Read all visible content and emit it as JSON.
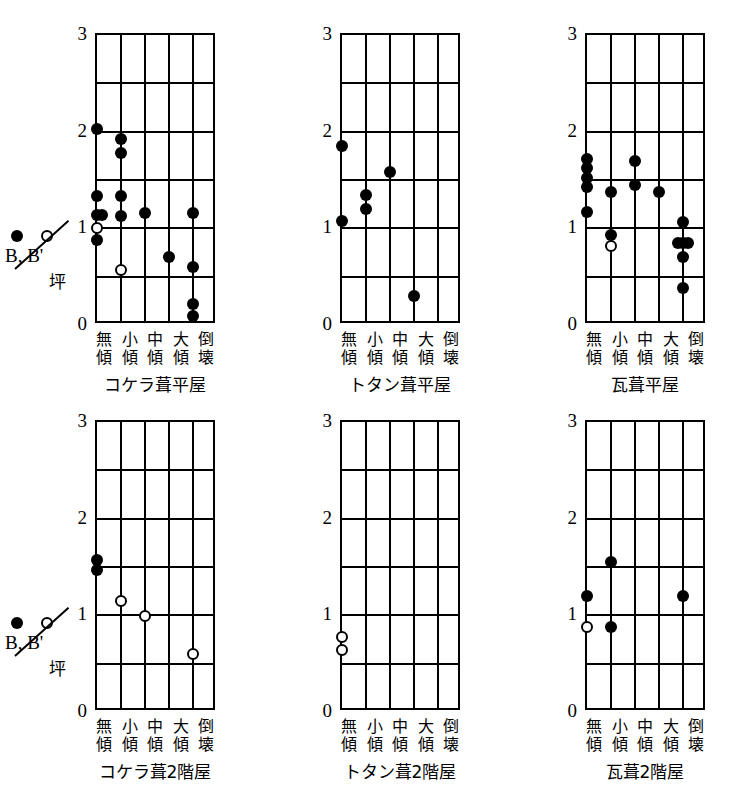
{
  "figure": {
    "legend": {
      "filled_symbol": "filled-circle",
      "open_symbol": "open-circle",
      "numerator": "B, B'",
      "denominator": "坪",
      "filled_label": "B",
      "open_label": "B'"
    },
    "axis": {
      "y_ticks": [
        "3",
        "2",
        "1",
        "0"
      ],
      "y_values": [
        3,
        2,
        1,
        0
      ],
      "y_min": 0,
      "y_max": 3,
      "y_minor_step": 0.5,
      "x_categories": [
        {
          "top": "無",
          "bottom": "傾"
        },
        {
          "top": "小",
          "bottom": "傾"
        },
        {
          "top": "中",
          "bottom": "傾"
        },
        {
          "top": "大",
          "bottom": "傾"
        },
        {
          "top": "倒",
          "bottom": "壊"
        }
      ]
    }
  },
  "chart_data": {
    "type": "scatter",
    "title": "",
    "xlabel": "",
    "ylabel": "B, B' / 坪",
    "ylim": [
      0,
      3
    ],
    "grid": true,
    "legend_position": "left",
    "categories": [
      "無傾",
      "小傾",
      "中傾",
      "大傾",
      "倒壊"
    ],
    "series_names": [
      "B",
      "B'"
    ],
    "panels": [
      {
        "title": "コケラ葺平屋",
        "row": 0,
        "col": 0,
        "points": [
          {
            "cat": 0,
            "x": 1,
            "y": 2.03,
            "series": "B"
          },
          {
            "cat": 0,
            "x": 1,
            "y": 1.33,
            "series": "B"
          },
          {
            "cat": 0,
            "x": 1,
            "y": 1.14,
            "series": "B"
          },
          {
            "cat": 0,
            "x": 1,
            "y": 1.0,
            "series": "B'"
          },
          {
            "cat": 0,
            "x": 1,
            "y": 0.88,
            "series": "B"
          },
          {
            "cat": 0,
            "x": 1.22,
            "y": 1.14,
            "series": "B"
          },
          {
            "cat": 1,
            "x": 2,
            "y": 1.92,
            "series": "B"
          },
          {
            "cat": 1,
            "x": 2,
            "y": 1.78,
            "series": "B"
          },
          {
            "cat": 1,
            "x": 2,
            "y": 1.33,
            "series": "B"
          },
          {
            "cat": 1,
            "x": 2,
            "y": 1.13,
            "series": "B"
          },
          {
            "cat": 1,
            "x": 2,
            "y": 0.57,
            "series": "B'"
          },
          {
            "cat": 2,
            "x": 3,
            "y": 1.16,
            "series": "B"
          },
          {
            "cat": 3,
            "x": 4,
            "y": 0.7,
            "series": "B"
          },
          {
            "cat": 4,
            "x": 5,
            "y": 1.16,
            "series": "B"
          },
          {
            "cat": 4,
            "x": 5,
            "y": 0.6,
            "series": "B"
          },
          {
            "cat": 4,
            "x": 5,
            "y": 0.22,
            "series": "B"
          },
          {
            "cat": 4,
            "x": 5,
            "y": 0.09,
            "series": "B"
          }
        ]
      },
      {
        "title": "トタン葺平屋",
        "row": 0,
        "col": 1,
        "points": [
          {
            "cat": 0,
            "x": 1,
            "y": 1.85,
            "series": "B"
          },
          {
            "cat": 0,
            "x": 1,
            "y": 1.08,
            "series": "B"
          },
          {
            "cat": 1,
            "x": 2,
            "y": 1.35,
            "series": "B"
          },
          {
            "cat": 1,
            "x": 2,
            "y": 1.2,
            "series": "B"
          },
          {
            "cat": 2,
            "x": 3,
            "y": 1.58,
            "series": "B"
          },
          {
            "cat": 3,
            "x": 4,
            "y": 0.3,
            "series": "B"
          }
        ]
      },
      {
        "title": "瓦葺平屋",
        "row": 0,
        "col": 2,
        "points": [
          {
            "cat": 0,
            "x": 1,
            "y": 1.72,
            "series": "B"
          },
          {
            "cat": 0,
            "x": 1,
            "y": 1.62,
            "series": "B"
          },
          {
            "cat": 0,
            "x": 1,
            "y": 1.52,
            "series": "B"
          },
          {
            "cat": 0,
            "x": 1,
            "y": 1.43,
            "series": "B"
          },
          {
            "cat": 0,
            "x": 1,
            "y": 1.17,
            "series": "B"
          },
          {
            "cat": 1,
            "x": 2,
            "y": 1.38,
            "series": "B"
          },
          {
            "cat": 1,
            "x": 2,
            "y": 0.93,
            "series": "B"
          },
          {
            "cat": 1,
            "x": 2,
            "y": 0.82,
            "series": "B'"
          },
          {
            "cat": 2,
            "x": 3,
            "y": 1.7,
            "series": "B"
          },
          {
            "cat": 2,
            "x": 3,
            "y": 1.45,
            "series": "B"
          },
          {
            "cat": 3,
            "x": 4,
            "y": 1.38,
            "series": "B"
          },
          {
            "cat": 4,
            "x": 5,
            "y": 1.07,
            "series": "B"
          },
          {
            "cat": 4,
            "x": 5,
            "y": 0.85,
            "series": "B"
          },
          {
            "cat": 4,
            "x": 4.78,
            "y": 0.85,
            "series": "B"
          },
          {
            "cat": 4,
            "x": 5.22,
            "y": 0.85,
            "series": "B"
          },
          {
            "cat": 4,
            "x": 5,
            "y": 0.7,
            "series": "B"
          },
          {
            "cat": 4,
            "x": 5,
            "y": 0.38,
            "series": "B"
          }
        ]
      },
      {
        "title": "コケラ葺2階屋",
        "row": 1,
        "col": 0,
        "points": [
          {
            "cat": 0,
            "x": 1,
            "y": 1.57,
            "series": "B"
          },
          {
            "cat": 0,
            "x": 1,
            "y": 1.47,
            "series": "B"
          },
          {
            "cat": 1,
            "x": 2,
            "y": 1.15,
            "series": "B'"
          },
          {
            "cat": 2,
            "x": 3,
            "y": 0.99,
            "series": "B'"
          },
          {
            "cat": 4,
            "x": 5,
            "y": 0.6,
            "series": "B'"
          }
        ]
      },
      {
        "title": "トタン葺2階屋",
        "row": 1,
        "col": 1,
        "points": [
          {
            "cat": 0,
            "x": 1,
            "y": 0.78,
            "series": "B'"
          },
          {
            "cat": 0,
            "x": 1,
            "y": 0.64,
            "series": "B'"
          }
        ]
      },
      {
        "title": "瓦葺2階屋",
        "row": 1,
        "col": 2,
        "points": [
          {
            "cat": 0,
            "x": 1,
            "y": 1.2,
            "series": "B"
          },
          {
            "cat": 0,
            "x": 1,
            "y": 0.88,
            "series": "B'"
          },
          {
            "cat": 1,
            "x": 2,
            "y": 1.55,
            "series": "B"
          },
          {
            "cat": 1,
            "x": 2,
            "y": 0.88,
            "series": "B"
          },
          {
            "cat": 4,
            "x": 5,
            "y": 1.2,
            "series": "B"
          }
        ]
      }
    ]
  }
}
